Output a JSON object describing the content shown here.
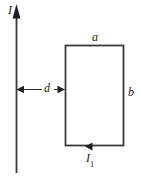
{
  "figure": {
    "name": "straight-wire-and-rectangular-loop",
    "type": "physics-diagram",
    "background_color": "#ffffff",
    "stroke_color": "#333333",
    "text_color": "#1a1a1a"
  },
  "labels": {
    "wire_current": "I",
    "loop_width": "a",
    "loop_height": "b",
    "separation": "d",
    "loop_current_base": "I",
    "loop_current_sub": "1"
  },
  "elements": {
    "wire": {
      "name": "current-carrying-wire",
      "x": 16,
      "y_top": 5,
      "y_bottom": 173,
      "arrow_direction": "up"
    },
    "loop": {
      "name": "rectangular-loop",
      "left": 65,
      "top": 45,
      "right": 124,
      "bottom": 146,
      "current_arrow_direction": "left",
      "current_arrow_x": 90,
      "current_arrow_y": 146
    },
    "dimension": {
      "name": "separation-dimension",
      "x_start": 16,
      "x_end": 65,
      "y": 89,
      "style": "double-headed-arrow"
    }
  }
}
